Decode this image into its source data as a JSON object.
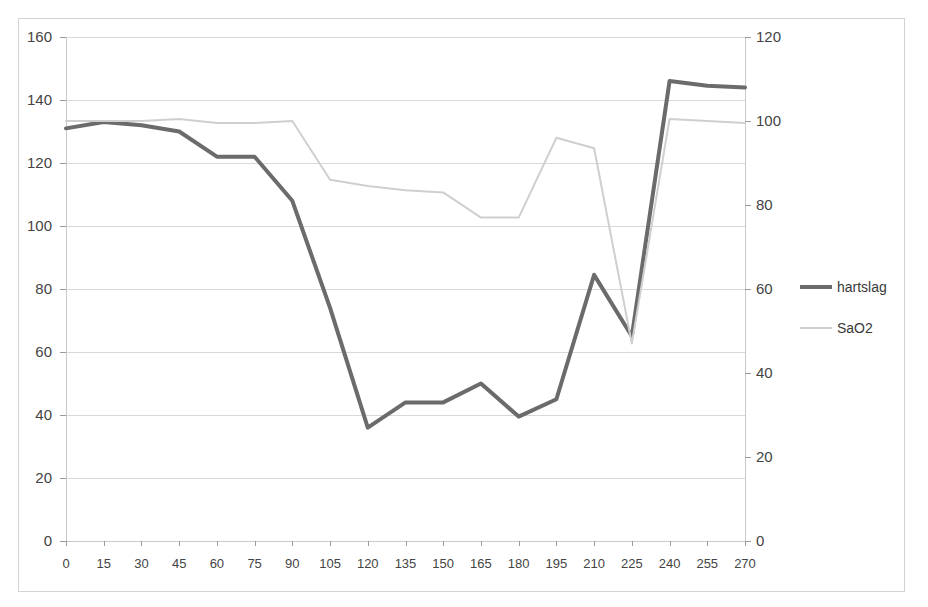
{
  "chart_data": {
    "type": "line",
    "title": "",
    "xlabel": "",
    "ylabel": "",
    "grid": true,
    "legend_position": "right",
    "x": [
      0,
      15,
      30,
      45,
      60,
      75,
      90,
      105,
      120,
      135,
      150,
      165,
      180,
      195,
      210,
      225,
      240,
      255,
      270
    ],
    "categories": [
      "0",
      "15",
      "30",
      "45",
      "60",
      "75",
      "90",
      "105",
      "120",
      "135",
      "150",
      "165",
      "180",
      "195",
      "210",
      "225",
      "240",
      "255",
      "270"
    ],
    "axes": {
      "left": {
        "label": "",
        "ylim": [
          0,
          160
        ],
        "tick_step": 20,
        "ticks": [
          0,
          20,
          40,
          60,
          80,
          100,
          120,
          140,
          160
        ],
        "tick_labels": [
          "0",
          "20",
          "40",
          "60",
          "80",
          "100",
          "120",
          "140",
          "160"
        ]
      },
      "right": {
        "label": "",
        "ylim": [
          0,
          120
        ],
        "tick_step": 20,
        "ticks": [
          0,
          20,
          40,
          60,
          80,
          100,
          120
        ],
        "tick_labels": [
          "0",
          "20",
          "40",
          "60",
          "80",
          "100",
          "120"
        ]
      },
      "x": {
        "label": "",
        "xlim": [
          0,
          270
        ],
        "tick_step": 15
      }
    },
    "series": [
      {
        "name": "hartslag",
        "axis": "left",
        "color": "#6b6b6b",
        "line_width": 4,
        "values": [
          131,
          133,
          132,
          130,
          122,
          122,
          108,
          74,
          36,
          44,
          44,
          50,
          39.5,
          45,
          84.5,
          65,
          146,
          144.5,
          144
        ]
      },
      {
        "name": "SaO2",
        "axis": "right",
        "color": "#cfcfcf",
        "line_width": 2,
        "values": [
          100,
          100,
          100,
          100.5,
          99.5,
          99.5,
          100,
          86,
          84.5,
          83.5,
          83,
          77,
          77,
          96,
          93.5,
          47,
          100.5,
          100,
          99.5
        ]
      }
    ]
  },
  "legend": {
    "items": [
      {
        "label": "hartslag",
        "color": "#6b6b6b"
      },
      {
        "label": "SaO2",
        "color": "#cfcfcf"
      }
    ]
  }
}
